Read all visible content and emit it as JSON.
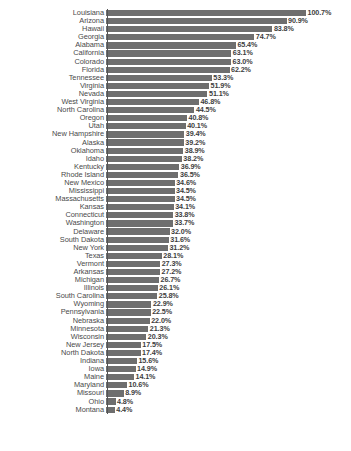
{
  "chart_data": {
    "type": "bar",
    "orientation": "horizontal",
    "title": "",
    "subtitle": "",
    "xlabel": "",
    "ylabel": "",
    "xlim": [
      0,
      100.7
    ],
    "grid": false,
    "legend": null,
    "value_suffix": "%",
    "bar_color": "#6e6e6e",
    "background_color": "#ffffff",
    "label_color": "#4a4a4a",
    "categories": [
      "Louisiana",
      "Arizona",
      "Hawaii",
      "Georgia",
      "Alabama",
      "California",
      "Colorado",
      "Florida",
      "Tennessee",
      "Virginia",
      "Nevada",
      "West Virginia",
      "North Carolina",
      "Oregon",
      "Utah",
      "New Hampshire",
      "Alaska",
      "Oklahoma",
      "Idaho",
      "Kentucky",
      "Rhode Island",
      "New Mexico",
      "Mississippi",
      "Massachusetts",
      "Kansas",
      "Connecticut",
      "Washington",
      "Delaware",
      "South Dakota",
      "New York",
      "Texas",
      "Vermont",
      "Arkansas",
      "Michigan",
      "Illinois",
      "South Carolina",
      "Wyoming",
      "Pennsylvania",
      "Nebraska",
      "Minnesota",
      "Wisconsin",
      "New Jersey",
      "North Dakota",
      "Indiana",
      "Iowa",
      "Maine",
      "Maryland",
      "Missouri",
      "Ohio",
      "Montana"
    ],
    "values": [
      100.7,
      90.9,
      83.8,
      74.7,
      65.4,
      63.1,
      63.0,
      62.2,
      53.3,
      51.9,
      51.1,
      46.8,
      44.5,
      40.8,
      40.1,
      39.4,
      39.2,
      38.9,
      38.2,
      36.9,
      36.5,
      34.6,
      34.5,
      34.5,
      34.1,
      33.8,
      33.7,
      32.0,
      31.6,
      31.2,
      28.1,
      27.3,
      27.2,
      26.7,
      26.1,
      25.8,
      22.9,
      22.5,
      22.0,
      21.3,
      20.3,
      17.5,
      17.4,
      15.6,
      14.9,
      14.1,
      10.6,
      8.9,
      4.8,
      4.4
    ],
    "value_labels": [
      "100.7%",
      "90.9%",
      "83.8%",
      "74.7%",
      "65.4%",
      "63.1%",
      "63.0%",
      "62.2%",
      "53.3%",
      "51.9%",
      "51.1%",
      "46.8%",
      "44.5%",
      "40.8%",
      "40.1%",
      "39.4%",
      "39.2%",
      "38.9%",
      "38.2%",
      "36.9%",
      "36.5%",
      "34.6%",
      "34.5%",
      "34.5%",
      "34.1%",
      "33.8%",
      "33.7%",
      "32.0%",
      "31.6%",
      "31.2%",
      "28.1%",
      "27.3%",
      "27.2%",
      "26.7%",
      "26.1%",
      "25.8%",
      "22.9%",
      "22.5%",
      "22.0%",
      "21.3%",
      "20.3%",
      "17.5%",
      "17.4%",
      "15.6%",
      "14.9%",
      "14.1%",
      "10.6%",
      "8.9%",
      "4.8%",
      "4.4%"
    ]
  },
  "caption": ""
}
